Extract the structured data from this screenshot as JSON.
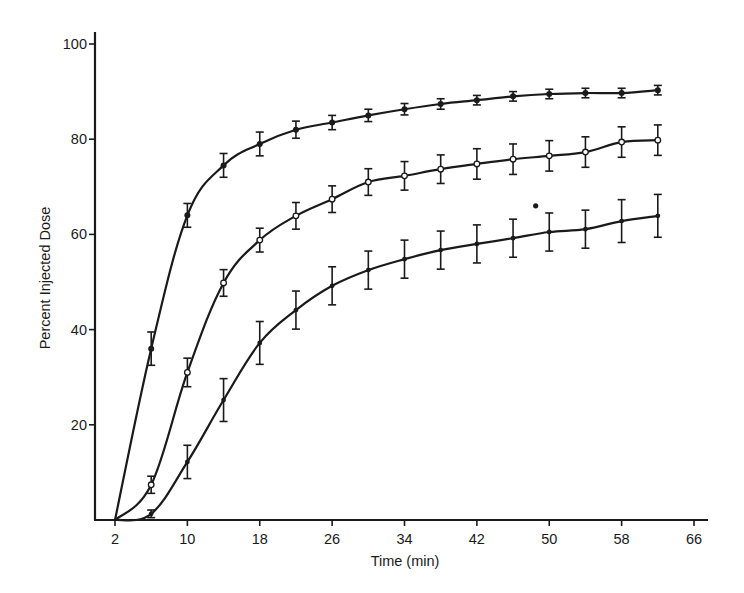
{
  "chart_data": {
    "type": "line",
    "title": "",
    "xlabel": "Time (min)",
    "ylabel": "Percent Injected Dose",
    "xlim": [
      2,
      66
    ],
    "ylim": [
      0,
      100
    ],
    "x_ticks": [
      2,
      10,
      18,
      26,
      34,
      42,
      50,
      58,
      66
    ],
    "y_ticks": [
      20,
      40,
      60,
      80,
      100
    ],
    "grid": false,
    "legend": null,
    "x": [
      2,
      6,
      10,
      14,
      18,
      22,
      26,
      30,
      34,
      38,
      42,
      46,
      50,
      54,
      58,
      62
    ],
    "series": [
      {
        "name": "upper curve (filled markers)",
        "marker": "filled",
        "values": [
          0,
          36,
          64,
          74.5,
          79,
          82,
          83.5,
          85,
          86.3,
          87.4,
          88.2,
          89,
          89.5,
          89.7,
          89.7,
          90.3
        ],
        "errors": [
          0,
          3.5,
          2.5,
          2.5,
          2.5,
          1.8,
          1.5,
          1.3,
          1.2,
          1.1,
          1,
          1,
          1,
          1,
          1,
          1
        ]
      },
      {
        "name": "middle curve (open circles)",
        "marker": "open",
        "values": [
          0,
          7.4,
          31,
          49.8,
          58.8,
          63.9,
          67.4,
          71,
          72.3,
          73.7,
          74.8,
          75.8,
          76.5,
          77.3,
          79.4,
          79.8
        ],
        "errors": [
          0,
          1.8,
          3,
          2.8,
          2.5,
          2.8,
          2.8,
          2.8,
          3,
          3,
          3.2,
          3.2,
          3.2,
          3.2,
          3.2,
          3.2
        ]
      },
      {
        "name": "lower curve (small dots)",
        "marker": "dot",
        "values": [
          0,
          1.3,
          12.2,
          25.2,
          37.2,
          44.1,
          49.2,
          52.5,
          54.8,
          56.7,
          58,
          59.2,
          60.5,
          61.1,
          62.8,
          63.9
        ],
        "errors": [
          0,
          0.8,
          3.5,
          4.5,
          4.5,
          4,
          4,
          4,
          4,
          4,
          4,
          4,
          4,
          4,
          4.5,
          4.5
        ]
      }
    ],
    "annotations": [
      {
        "type": "stray-dot",
        "x": 48.5,
        "y": 66
      }
    ]
  },
  "style": {
    "ink": "#1a1a1a",
    "background": "#ffffff"
  },
  "layout": {
    "x_px": [
      115,
      694
    ],
    "y_px": [
      520,
      44
    ],
    "axis_left": 95,
    "axis_bottom": 520,
    "axis_right": 708,
    "axis_top": 32
  }
}
